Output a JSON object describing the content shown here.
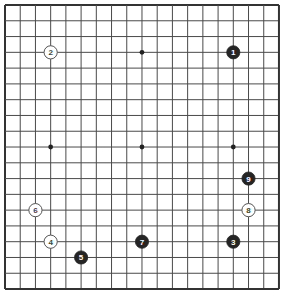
{
  "board": {
    "size": 19,
    "origin": {
      "x": 5,
      "y": 5
    },
    "spacing": {
      "x": 15.22,
      "y": 15.78
    },
    "line_color": "#4a4a4a",
    "border_color": "#333333",
    "background": "#ffffff",
    "hoshi": [
      [
        3,
        3
      ],
      [
        9,
        3
      ],
      [
        15,
        3
      ],
      [
        3,
        9
      ],
      [
        9,
        9
      ],
      [
        15,
        9
      ],
      [
        3,
        15
      ],
      [
        9,
        15
      ],
      [
        15,
        15
      ]
    ],
    "visible_hoshi": [
      [
        9,
        3
      ],
      [
        3,
        9
      ],
      [
        9,
        9
      ],
      [
        15,
        9
      ]
    ]
  },
  "stones": [
    {
      "move": "1",
      "color": "black",
      "col": 15,
      "row": 3
    },
    {
      "move": "2",
      "color": "white",
      "col": 3,
      "row": 3
    },
    {
      "move": "3",
      "color": "black",
      "col": 15,
      "row": 15
    },
    {
      "move": "4",
      "color": "white",
      "col": 3,
      "row": 15
    },
    {
      "move": "5",
      "color": "black",
      "col": 5,
      "row": 16
    },
    {
      "move": "6",
      "color": "white",
      "col": 2,
      "row": 13
    },
    {
      "move": "7",
      "color": "black",
      "col": 9,
      "row": 15
    },
    {
      "move": "8",
      "color": "white",
      "col": 16,
      "row": 13
    },
    {
      "move": "9",
      "color": "black",
      "col": 16,
      "row": 11
    }
  ],
  "colors": {
    "black_stone": "#252525",
    "black_stone_text": "#ffffff",
    "white_stone": "#ffffff",
    "white_stone_border": "#555555",
    "white_stone_text": "#444444"
  }
}
